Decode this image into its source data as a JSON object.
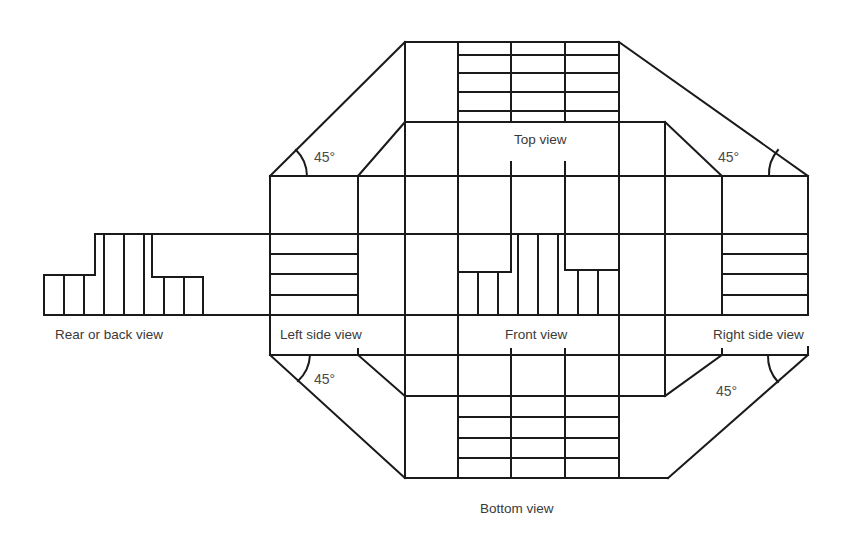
{
  "diagram": {
    "colors": {
      "line": "#1a1a1a",
      "text": "#3a3a3a",
      "background": "#ffffff"
    },
    "views": {
      "top": "Top view",
      "front": "Front view",
      "left": "Left side view",
      "right": "Right side view",
      "rear": "Rear or back view",
      "bottom": "Bottom view"
    },
    "angles": {
      "top_left": "45°",
      "top_right": "45°",
      "bottom_left": "45°",
      "bottom_right": "45°"
    }
  }
}
